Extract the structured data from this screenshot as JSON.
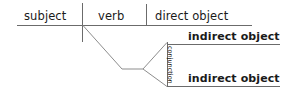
{
  "diagram": {
    "canvas": {
      "width": 291,
      "height": 91,
      "background": "#ffffff"
    },
    "line_color": "#6b6b6b",
    "text_color": "#1a1a1a",
    "labels": {
      "subject": "subject",
      "verb": "verb",
      "direct_object": "direct object",
      "indirect_object_1": "indirect object",
      "indirect_object_2": "indirect object",
      "conjunction": "conjunction"
    },
    "lines": {
      "baseline": {
        "x1": 17,
        "y1": 25,
        "x2": 252,
        "y2": 25
      },
      "subject_verb_divider": {
        "x1": 82.5,
        "y1": 3,
        "x2": 82.5,
        "y2": 42
      },
      "verb_object_divider": {
        "x1": 146.5,
        "y1": 4,
        "x2": 146.5,
        "y2": 25
      },
      "prep_descender": {
        "x1": 83,
        "y1": 25,
        "x2": 122,
        "y2": 69
      },
      "prep_horizontal": {
        "x1": 122,
        "y1": 69,
        "x2": 143,
        "y2": 69
      },
      "fork_upper": {
        "x1": 143,
        "y1": 69,
        "x2": 167,
        "y2": 42
      },
      "fork_lower": {
        "x1": 143,
        "y1": 69,
        "x2": 167,
        "y2": 87
      },
      "conjunction_connector": {
        "x1": 167,
        "y1": 42,
        "x2": 167,
        "y2": 87
      },
      "indirect_object_1_baseline": {
        "x1": 167,
        "y1": 44,
        "x2": 280,
        "y2": 44
      },
      "indirect_object_2_baseline": {
        "x1": 167,
        "y1": 87,
        "x2": 280,
        "y2": 87
      }
    }
  }
}
